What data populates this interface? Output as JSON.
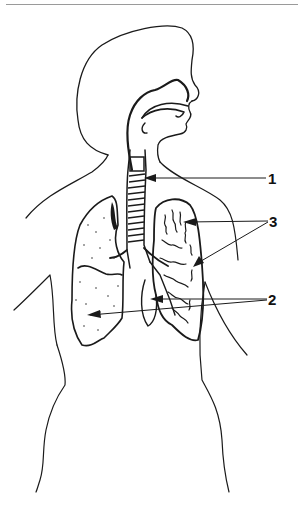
{
  "diagram": {
    "labels": [
      {
        "id": "1",
        "text": "1",
        "points_to": "trachea"
      },
      {
        "id": "3",
        "text": "3",
        "points_to": "bronchial tree / bronchioles"
      },
      {
        "id": "2",
        "text": "2",
        "points_to": "lungs"
      }
    ]
  },
  "colors": {
    "line": "#1a1a1a",
    "rule": "#9a9a9a",
    "background": "#ffffff"
  }
}
